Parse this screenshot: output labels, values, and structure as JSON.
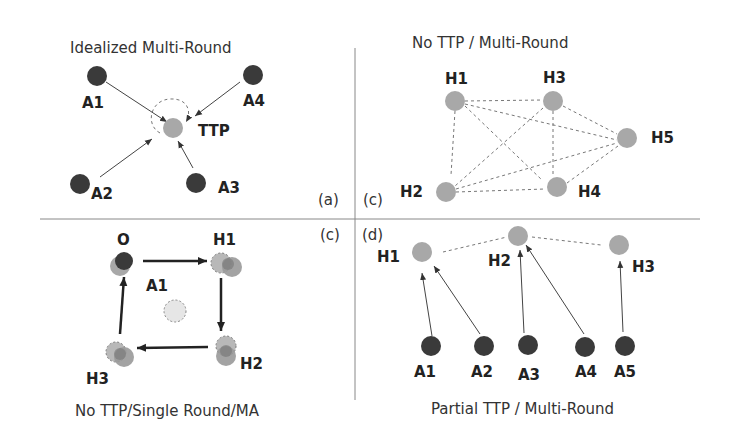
{
  "panels": {
    "a": {
      "title": "Idealized Multi-Round",
      "tag": "(a)",
      "nodes": {
        "A1": "A1",
        "A2": "A2",
        "A3": "A3",
        "A4": "A4",
        "TTP": "TTP"
      }
    },
    "b": {
      "title": "No TTP / Multi-Round",
      "tag": "(c)",
      "nodes": {
        "H1": "H1",
        "H2": "H2",
        "H3": "H3",
        "H4": "H4",
        "H5": "H5"
      }
    },
    "c": {
      "title": "No TTP/Single Round/MA",
      "tag": "(c)",
      "nodes": {
        "O": "O",
        "A1": "A1",
        "H1": "H1",
        "H2": "H2",
        "H3": "H3"
      }
    },
    "d": {
      "title": "Partial TTP / Multi-Round",
      "tag": "(d)",
      "nodes": {
        "H1": "H1",
        "H2": "H2",
        "H3": "H3",
        "A1": "A1",
        "A2": "A2",
        "A3": "A3",
        "A4": "A4",
        "A5": "A5"
      }
    }
  },
  "colors": {
    "dark_node": "#3a3a3a",
    "grey_node": "#a8a8a8",
    "light_node": "#dedede"
  }
}
